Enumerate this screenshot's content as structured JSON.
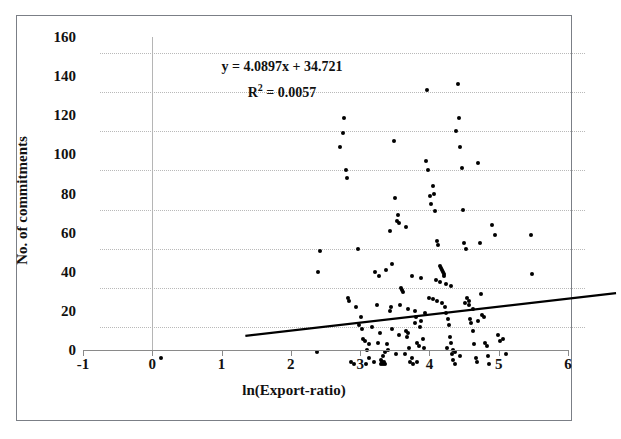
{
  "chart_data": {
    "type": "scatter",
    "title": "",
    "xlabel": "ln(Export-ratio)",
    "ylabel": "No. of commitments",
    "xlim": [
      -1,
      6
    ],
    "ylim": [
      0,
      160
    ],
    "xticks": [
      -1,
      0,
      1,
      2,
      3,
      4,
      5,
      6
    ],
    "xtick_labels": [
      "-1",
      "0",
      "1",
      "2",
      "3",
      "4",
      "5",
      "6"
    ],
    "yticks": [
      0,
      20,
      40,
      60,
      80,
      100,
      120,
      140,
      160
    ],
    "ytick_labels": [
      "0",
      "20",
      "40",
      "60",
      "80",
      "100",
      "120",
      "140",
      "160"
    ],
    "grid": "horizontal-dotted",
    "legend": "none",
    "marker": "filled-diamond-black",
    "annotations": [
      {
        "name": "regression-equation",
        "text": "y = 4.0897x + 34.721"
      },
      {
        "name": "r-squared",
        "text": "R",
        "sup": "2",
        "rest": " = 0.0057"
      }
    ],
    "trendline": {
      "type": "linear",
      "slope": 4.0897,
      "intercept": 34.721,
      "r_squared": 0.0057,
      "x_start": -0.1,
      "x_end": 5.25,
      "color": "#000000"
    },
    "points": [
      [
        -0.12,
        4
      ],
      [
        2.13,
        7
      ],
      [
        2.15,
        48
      ],
      [
        2.18,
        59
      ],
      [
        2.47,
        112
      ],
      [
        2.5,
        119
      ],
      [
        2.52,
        127
      ],
      [
        2.55,
        100
      ],
      [
        2.56,
        96
      ],
      [
        2.58,
        35
      ],
      [
        2.6,
        33
      ],
      [
        2.62,
        2
      ],
      [
        2.66,
        1
      ],
      [
        2.72,
        60
      ],
      [
        2.76,
        25
      ],
      [
        2.8,
        14
      ],
      [
        2.82,
        13
      ],
      [
        2.84,
        1
      ],
      [
        2.88,
        4
      ],
      [
        2.92,
        20
      ],
      [
        2.95,
        2
      ],
      [
        2.97,
        48
      ],
      [
        3.0,
        31
      ],
      [
        3.02,
        46
      ],
      [
        3.04,
        17
      ],
      [
        3.05,
        1
      ],
      [
        3.06,
        3
      ],
      [
        3.07,
        2
      ],
      [
        3.08,
        1
      ],
      [
        3.09,
        5
      ],
      [
        3.1,
        2
      ],
      [
        3.12,
        1
      ],
      [
        3.14,
        11
      ],
      [
        3.16,
        8
      ],
      [
        3.18,
        28
      ],
      [
        3.2,
        30
      ],
      [
        3.22,
        52
      ],
      [
        3.24,
        115
      ],
      [
        3.26,
        86
      ],
      [
        3.28,
        74
      ],
      [
        3.3,
        77
      ],
      [
        3.32,
        73
      ],
      [
        3.34,
        40
      ],
      [
        3.36,
        39
      ],
      [
        3.38,
        38
      ],
      [
        3.4,
        6
      ],
      [
        3.42,
        18
      ],
      [
        3.44,
        17
      ],
      [
        3.46,
        9
      ],
      [
        3.48,
        2
      ],
      [
        3.5,
        4
      ],
      [
        3.52,
        1
      ],
      [
        3.54,
        22
      ],
      [
        3.56,
        25
      ],
      [
        3.58,
        2
      ],
      [
        3.6,
        10
      ],
      [
        3.62,
        20
      ],
      [
        3.64,
        23
      ],
      [
        3.66,
        14
      ],
      [
        3.68,
        9
      ],
      [
        3.7,
        105
      ],
      [
        3.72,
        141
      ],
      [
        3.74,
        100
      ],
      [
        3.76,
        87
      ],
      [
        3.78,
        83
      ],
      [
        3.8,
        92
      ],
      [
        3.82,
        88
      ],
      [
        3.84,
        79
      ],
      [
        3.86,
        64
      ],
      [
        3.88,
        62
      ],
      [
        3.9,
        51
      ],
      [
        3.92,
        50
      ],
      [
        3.94,
        49
      ],
      [
        3.95,
        48
      ],
      [
        3.96,
        47
      ],
      [
        3.97,
        46
      ],
      [
        3.98,
        30
      ],
      [
        4.0,
        27
      ],
      [
        4.02,
        24
      ],
      [
        4.04,
        21
      ],
      [
        4.05,
        15
      ],
      [
        4.06,
        12
      ],
      [
        4.08,
        6
      ],
      [
        4.1,
        3
      ],
      [
        4.12,
        1
      ],
      [
        4.14,
        120
      ],
      [
        4.16,
        144
      ],
      [
        4.18,
        127
      ],
      [
        4.2,
        112
      ],
      [
        4.22,
        101
      ],
      [
        4.24,
        80
      ],
      [
        4.26,
        63
      ],
      [
        4.28,
        60
      ],
      [
        4.3,
        35
      ],
      [
        4.32,
        33
      ],
      [
        4.34,
        24
      ],
      [
        4.36,
        22
      ],
      [
        4.38,
        18
      ],
      [
        4.4,
        11
      ],
      [
        4.42,
        4
      ],
      [
        4.44,
        2
      ],
      [
        4.46,
        104
      ],
      [
        4.48,
        63
      ],
      [
        4.5,
        37
      ],
      [
        4.52,
        26
      ],
      [
        4.54,
        25
      ],
      [
        4.56,
        12
      ],
      [
        4.58,
        10
      ],
      [
        4.6,
        5
      ],
      [
        4.62,
        1
      ],
      [
        4.66,
        72
      ],
      [
        4.7,
        67
      ],
      [
        4.74,
        16
      ],
      [
        4.78,
        13
      ],
      [
        4.82,
        14
      ],
      [
        4.86,
        6
      ],
      [
        5.22,
        67
      ],
      [
        5.24,
        47
      ],
      [
        3.19,
        69
      ],
      [
        3.41,
        71
      ],
      [
        3.13,
        49
      ],
      [
        3.5,
        46
      ],
      [
        3.63,
        45
      ],
      [
        3.85,
        44
      ],
      [
        3.91,
        43
      ],
      [
        3.99,
        42
      ],
      [
        4.07,
        41
      ],
      [
        3.33,
        31
      ],
      [
        3.45,
        29
      ],
      [
        3.55,
        28
      ],
      [
        3.69,
        27
      ],
      [
        3.21,
        19
      ],
      [
        3.31,
        16
      ],
      [
        3.43,
        15
      ],
      [
        3.57,
        12
      ],
      [
        2.88,
        11
      ],
      [
        3.01,
        12
      ],
      [
        3.11,
        7
      ],
      [
        3.27,
        6
      ],
      [
        4.01,
        9
      ],
      [
        4.09,
        8
      ],
      [
        4.13,
        7
      ],
      [
        4.19,
        5
      ],
      [
        2.7,
        30
      ],
      [
        2.74,
        21
      ],
      [
        2.78,
        19
      ],
      [
        2.86,
        8
      ],
      [
        3.75,
        35
      ],
      [
        3.81,
        34
      ],
      [
        3.87,
        33
      ],
      [
        3.93,
        32
      ],
      [
        4.27,
        32
      ],
      [
        4.33,
        31
      ],
      [
        4.39,
        29
      ],
      [
        4.45,
        23
      ]
    ]
  }
}
